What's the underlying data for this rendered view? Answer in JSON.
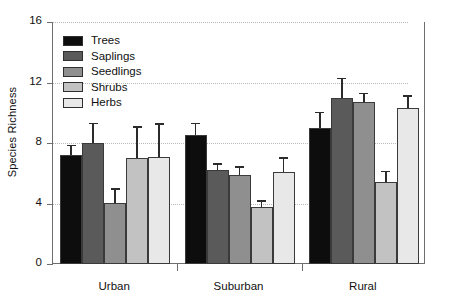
{
  "chart_data": {
    "type": "bar",
    "title": "",
    "xlabel": "",
    "ylabel": "Species Richness",
    "categories": [
      "Urban",
      "Suburban",
      "Rural"
    ],
    "ylim": [
      0,
      16
    ],
    "yticks": [
      0,
      4,
      8,
      12,
      16
    ],
    "grid": "horizontal-dotted",
    "legend_position": "top-left-inside",
    "series": [
      {
        "name": "Trees",
        "color": "#0d0d0d",
        "values": [
          7.2,
          8.5,
          9.0
        ],
        "errors": [
          0.7,
          0.85,
          1.05
        ]
      },
      {
        "name": "Saplings",
        "color": "#5a5a5a",
        "values": [
          8.0,
          6.2,
          11.0
        ],
        "errors": [
          1.35,
          0.45,
          1.3
        ]
      },
      {
        "name": "Seedlings",
        "color": "#8f8f8f",
        "values": [
          4.05,
          5.9,
          10.7
        ],
        "errors": [
          0.95,
          0.55,
          0.6
        ]
      },
      {
        "name": "Shrubs",
        "color": "#c2c2c2",
        "values": [
          7.0,
          3.75,
          5.4
        ],
        "errors": [
          2.1,
          0.45,
          0.75
        ]
      },
      {
        "name": "Herbs",
        "color": "#e8e8e8",
        "values": [
          7.1,
          6.1,
          10.3
        ],
        "errors": [
          2.2,
          0.95,
          0.85
        ]
      }
    ]
  },
  "axis": {
    "y_tick_labels": [
      "0",
      "4",
      "8",
      "12",
      "16"
    ],
    "y_axis_title": "Species Richness",
    "x_group_labels": [
      "Urban",
      "Suburban",
      "Rural"
    ]
  },
  "legend": {
    "items": [
      {
        "label": "Trees"
      },
      {
        "label": "Saplings"
      },
      {
        "label": "Seedlings"
      },
      {
        "label": "Shrubs"
      },
      {
        "label": "Herbs"
      }
    ]
  }
}
